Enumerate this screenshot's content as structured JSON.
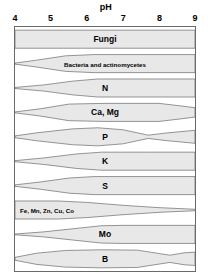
{
  "chart_data": {
    "type": "area",
    "title": "pH",
    "xlabel": "pH",
    "ylabel": "",
    "xlim": [
      4,
      9
    ],
    "grid": false,
    "legend": "none",
    "tick_labels": [
      "4",
      "5",
      "6",
      "7",
      "8",
      "9"
    ],
    "tick_values": [
      4,
      5,
      6,
      7,
      8,
      9
    ],
    "series": [
      {
        "name": "Fungi",
        "label": "Fungi",
        "label_align": "center",
        "widths": [
          {
            "ph": 4.0,
            "w": 1.0
          },
          {
            "ph": 5.0,
            "w": 1.0
          },
          {
            "ph": 6.0,
            "w": 1.0
          },
          {
            "ph": 7.0,
            "w": 1.0
          },
          {
            "ph": 8.0,
            "w": 1.0
          },
          {
            "ph": 9.0,
            "w": 1.0
          }
        ]
      },
      {
        "name": "Bacteria and actinomycetes",
        "label": "Bacteria and actinomycetes",
        "label_align": "center",
        "widths": [
          {
            "ph": 4.0,
            "w": 0.06
          },
          {
            "ph": 4.6,
            "w": 0.38
          },
          {
            "ph": 5.4,
            "w": 0.86
          },
          {
            "ph": 6.2,
            "w": 1.0
          },
          {
            "ph": 7.5,
            "w": 1.0
          },
          {
            "ph": 9.0,
            "w": 1.0
          }
        ]
      },
      {
        "name": "N",
        "label": "N",
        "label_align": "center",
        "widths": [
          {
            "ph": 4.0,
            "w": 0.06
          },
          {
            "ph": 4.8,
            "w": 0.34
          },
          {
            "ph": 5.6,
            "w": 0.76
          },
          {
            "ph": 6.3,
            "w": 1.0
          },
          {
            "ph": 7.5,
            "w": 1.0
          },
          {
            "ph": 9.0,
            "w": 1.0
          }
        ]
      },
      {
        "name": "Ca, Mg",
        "label": "Ca, Mg",
        "label_align": "center",
        "widths": [
          {
            "ph": 4.0,
            "w": 0.05
          },
          {
            "ph": 4.7,
            "w": 0.4
          },
          {
            "ph": 5.5,
            "w": 0.92
          },
          {
            "ph": 6.5,
            "w": 1.0
          },
          {
            "ph": 8.0,
            "w": 1.0
          },
          {
            "ph": 8.6,
            "w": 0.72
          },
          {
            "ph": 9.0,
            "w": 0.52
          }
        ]
      },
      {
        "name": "P",
        "label": "P",
        "label_align": "center",
        "widths": [
          {
            "ph": 4.0,
            "w": 0.1
          },
          {
            "ph": 4.6,
            "w": 0.44
          },
          {
            "ph": 5.6,
            "w": 0.88
          },
          {
            "ph": 6.3,
            "w": 1.0
          },
          {
            "ph": 7.0,
            "w": 0.78
          },
          {
            "ph": 7.7,
            "w": 0.18
          },
          {
            "ph": 8.2,
            "w": 0.42
          },
          {
            "ph": 9.0,
            "w": 0.72
          }
        ]
      },
      {
        "name": "K",
        "label": "K",
        "label_align": "center",
        "widths": [
          {
            "ph": 4.0,
            "w": 0.06
          },
          {
            "ph": 4.8,
            "w": 0.36
          },
          {
            "ph": 5.7,
            "w": 0.8
          },
          {
            "ph": 6.4,
            "w": 1.0
          },
          {
            "ph": 7.6,
            "w": 1.0
          },
          {
            "ph": 9.0,
            "w": 1.0
          }
        ]
      },
      {
        "name": "S",
        "label": "S",
        "label_align": "center",
        "widths": [
          {
            "ph": 4.0,
            "w": 0.08
          },
          {
            "ph": 4.7,
            "w": 0.4
          },
          {
            "ph": 5.5,
            "w": 0.84
          },
          {
            "ph": 6.2,
            "w": 1.0
          },
          {
            "ph": 7.5,
            "w": 1.0
          },
          {
            "ph": 9.0,
            "w": 1.0
          }
        ]
      },
      {
        "name": "Fe, Mn, Zn, Cu, Co",
        "label": "Fe, Mn, Zn, Cu, Co",
        "label_align": "left",
        "widths": [
          {
            "ph": 4.0,
            "w": 1.0
          },
          {
            "ph": 5.2,
            "w": 1.0
          },
          {
            "ph": 6.0,
            "w": 0.84
          },
          {
            "ph": 7.0,
            "w": 0.52
          },
          {
            "ph": 8.0,
            "w": 0.26
          },
          {
            "ph": 9.0,
            "w": 0.08
          }
        ]
      },
      {
        "name": "Mo",
        "label": "Mo",
        "label_align": "center",
        "widths": [
          {
            "ph": 4.0,
            "w": 0.04
          },
          {
            "ph": 4.8,
            "w": 0.28
          },
          {
            "ph": 5.6,
            "w": 0.62
          },
          {
            "ph": 6.4,
            "w": 0.96
          },
          {
            "ph": 7.0,
            "w": 1.0
          },
          {
            "ph": 9.0,
            "w": 1.0
          }
        ]
      },
      {
        "name": "B",
        "label": "B",
        "label_align": "center",
        "widths": [
          {
            "ph": 4.0,
            "w": 0.16
          },
          {
            "ph": 4.6,
            "w": 0.62
          },
          {
            "ph": 5.4,
            "w": 0.92
          },
          {
            "ph": 6.4,
            "w": 1.0
          },
          {
            "ph": 7.4,
            "w": 0.96
          },
          {
            "ph": 8.3,
            "w": 0.4
          },
          {
            "ph": 8.7,
            "w": 0.66
          },
          {
            "ph": 9.0,
            "w": 0.74
          }
        ]
      }
    ]
  },
  "style": {
    "band_fill": "#e8e8e8",
    "band_stroke": "#6a6a6a",
    "border_color": "#6a6a6a",
    "text_color": "#000000",
    "background": "#ffffff"
  }
}
